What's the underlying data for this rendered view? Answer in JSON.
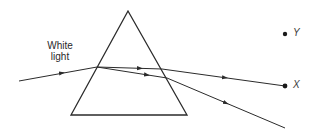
{
  "diagram": {
    "title": "",
    "labels": {
      "incident": [
        "White",
        "light"
      ],
      "point_y": "Y",
      "point_x": "X"
    },
    "colors": {
      "line": "#2b2b2b",
      "background": "#ffffff"
    },
    "prism": {
      "apex": [
        128,
        11
      ],
      "base_left": [
        71,
        115
      ],
      "base_right": [
        187,
        115
      ]
    },
    "rays": {
      "incident": {
        "from": [
          19,
          81
        ],
        "to": [
          97,
          67
        ]
      },
      "upper_inside": {
        "from": [
          97,
          67
        ],
        "to": [
          162,
          69
        ]
      },
      "lower_inside": {
        "from": [
          97,
          67
        ],
        "to": [
          167,
          78
        ]
      },
      "upper_outside": {
        "from": [
          162,
          69
        ],
        "to": [
          285,
          86
        ]
      },
      "lower_outside": {
        "from": [
          167,
          78
        ],
        "to": [
          285,
          128
        ]
      }
    },
    "points": {
      "Y": [
        285,
        34
      ],
      "X": [
        285,
        86
      ]
    }
  }
}
